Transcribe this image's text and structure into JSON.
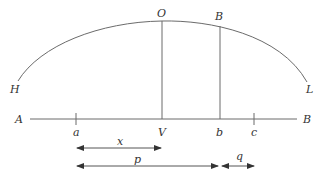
{
  "diagram": {
    "type": "geometry-trajectory",
    "colors": {
      "line": "#6b6b6b",
      "text": "#333333",
      "background": "#ffffff"
    },
    "curve": {
      "start_label": "H",
      "apex_label": "O",
      "end_label": "L"
    },
    "baseline": {
      "left_label": "A",
      "right_label": "B"
    },
    "verticals": [
      {
        "top_label": "O",
        "foot_label": "V"
      },
      {
        "top_label": "B",
        "foot_label": "b"
      }
    ],
    "ticks": [
      {
        "label": "a"
      },
      {
        "label": "c"
      }
    ],
    "dimensions": [
      {
        "label": "x",
        "from": "a",
        "to": "V"
      },
      {
        "label": "p",
        "from": "a",
        "to": "b"
      },
      {
        "label": "q",
        "from": "b",
        "to": "c"
      }
    ]
  }
}
